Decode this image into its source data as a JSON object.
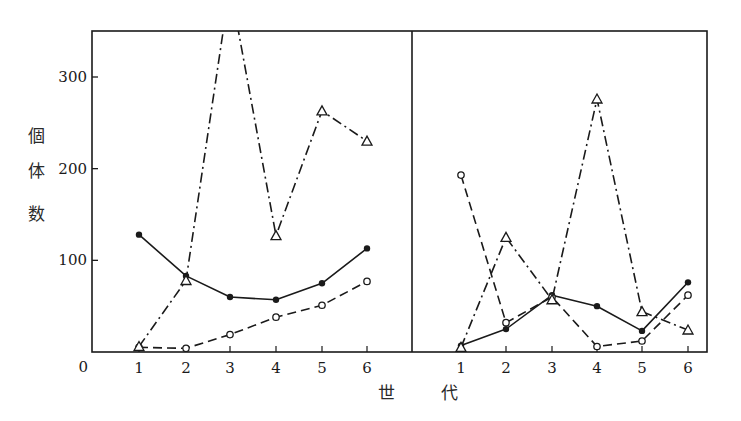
{
  "chart_data": {
    "type": "line",
    "title": "",
    "xlabel": "世　代",
    "ylabel": "個体数",
    "ylabel_chars": [
      "個",
      "体",
      "数"
    ],
    "xlabel_chars": [
      "世",
      "代"
    ],
    "ylim": [
      0,
      350
    ],
    "y_ticks": [
      0,
      100,
      200,
      300
    ],
    "y_tick_labels": [
      "0",
      "100",
      "200",
      "300"
    ],
    "x_ticks": [
      1,
      2,
      3,
      4,
      5,
      6
    ],
    "x_tick_labels": [
      "1",
      "2",
      "3",
      "4",
      "5",
      "6"
    ],
    "grid": false,
    "legend": "none",
    "panels": [
      {
        "name": "left",
        "x": [
          1,
          2,
          3,
          4,
          5,
          6
        ],
        "series": [
          {
            "name": "filled-circle",
            "marker": "filled-circle",
            "line": "solid",
            "values": [
              128,
              83,
              60,
              57,
              75,
              113
            ]
          },
          {
            "name": "open-circle",
            "marker": "open-circle",
            "line": "dashed",
            "values": [
              5,
              4,
              19,
              38,
              51,
              77
            ]
          },
          {
            "name": "open-triangle",
            "marker": "open-triangle",
            "line": "dash-dot",
            "values": [
              6,
              78,
              400,
              127,
              263,
              230
            ],
            "note": "generation 3 value exceeds plot top (off-scale)"
          }
        ]
      },
      {
        "name": "right",
        "x": [
          1,
          2,
          3,
          4,
          5,
          6
        ],
        "series": [
          {
            "name": "filled-circle",
            "marker": "filled-circle",
            "line": "solid",
            "values": [
              7,
              25,
              62,
              50,
              23,
              76
            ]
          },
          {
            "name": "open-circle",
            "marker": "open-circle",
            "line": "dashed",
            "values": [
              193,
              32,
              60,
              6,
              12,
              62
            ]
          },
          {
            "name": "open-triangle",
            "marker": "open-triangle",
            "line": "dash-dot",
            "values": [
              5,
              125,
              57,
              276,
              44,
              24
            ]
          }
        ]
      }
    ]
  }
}
